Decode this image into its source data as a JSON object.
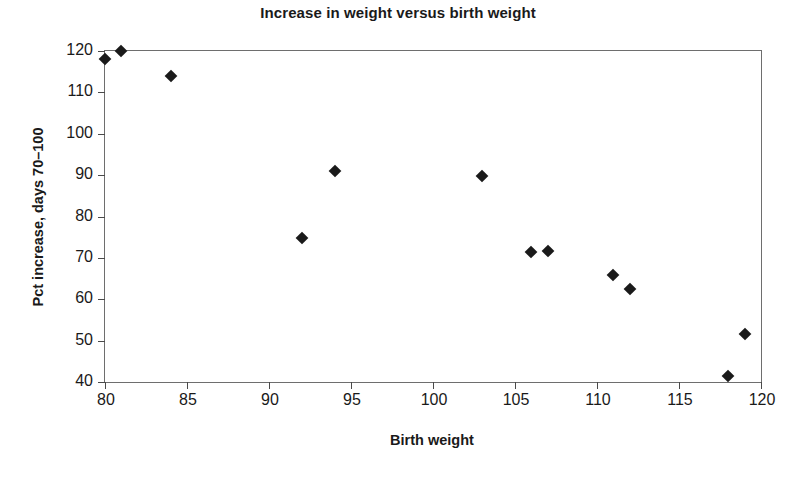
{
  "chart_data": {
    "type": "scatter",
    "title": "Increase in weight versus birth weight",
    "xlabel": "Birth weight",
    "ylabel": "Pct increase, days 70–100",
    "xlim": [
      80,
      120
    ],
    "ylim": [
      40,
      120
    ],
    "xticks": [
      80,
      85,
      90,
      95,
      100,
      105,
      110,
      115,
      120
    ],
    "yticks": [
      40,
      50,
      60,
      70,
      80,
      90,
      100,
      110,
      120
    ],
    "grid": false,
    "legend": false,
    "marker": "filled-diamond",
    "marker_color": "#1a1a1a",
    "series": [
      {
        "name": "observations",
        "points": [
          {
            "x": 80,
            "y": 118
          },
          {
            "x": 81,
            "y": 120
          },
          {
            "x": 84,
            "y": 114
          },
          {
            "x": 92,
            "y": 74.8
          },
          {
            "x": 94,
            "y": 91
          },
          {
            "x": 103,
            "y": 89.7
          },
          {
            "x": 106,
            "y": 71.5
          },
          {
            "x": 107,
            "y": 71.6
          },
          {
            "x": 111,
            "y": 65.8
          },
          {
            "x": 112,
            "y": 62.5
          },
          {
            "x": 118,
            "y": 41.5
          },
          {
            "x": 119,
            "y": 51.5
          }
        ]
      }
    ]
  }
}
